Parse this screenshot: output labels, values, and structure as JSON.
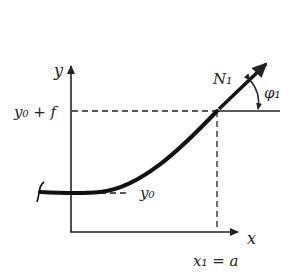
{
  "diagram": {
    "type": "beam-deflection-sketch",
    "axes": {
      "x_label": "x",
      "y_label": "y"
    },
    "labels": {
      "y_top": "y₀ + f",
      "y_bottom": "y₀",
      "x_point": "x₁ = a",
      "force": "N₁",
      "angle": "φ₁"
    },
    "colors": {
      "ink": "#222222",
      "background": "#ffffff"
    }
  }
}
